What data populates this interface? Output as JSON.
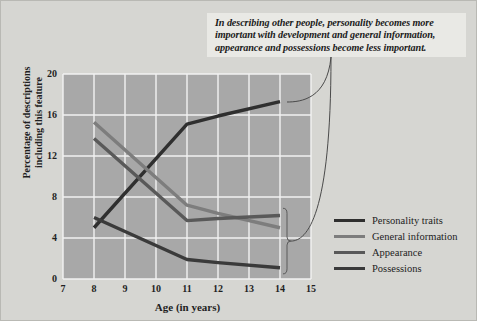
{
  "annotation": {
    "text": "In describing other people, personality becomes more important with development and general information, appearance and possessions become less important."
  },
  "chart_data": {
    "type": "line",
    "title": "",
    "xlabel": "Age (in years)",
    "ylabel": "Percentage of descriptions including this feature",
    "xlim": [
      7,
      15
    ],
    "ylim": [
      0,
      20
    ],
    "xticks": [
      "7",
      "8",
      "9",
      "10",
      "11",
      "12",
      "13",
      "14",
      "15"
    ],
    "yticks": [
      "0",
      "4",
      "8",
      "12",
      "16",
      "20"
    ],
    "grid": true,
    "legend_position": "right",
    "x": [
      8,
      11,
      12,
      14
    ],
    "series": [
      {
        "name": "Personality traits",
        "color": "#2f2f2f",
        "values": [
          5.0,
          15.1,
          15.9,
          17.3
        ]
      },
      {
        "name": "General information",
        "color": "#7d7d7d",
        "values": [
          15.3,
          7.2,
          6.4,
          5.0
        ]
      },
      {
        "name": "Appearance",
        "color": "#595959",
        "values": [
          13.7,
          5.7,
          5.9,
          6.2
        ]
      },
      {
        "name": "Possessions",
        "color": "#3a3a3a",
        "values": [
          6.0,
          1.9,
          1.6,
          1.1
        ]
      }
    ]
  },
  "legend": {
    "items": [
      {
        "label": "Personality traits",
        "color": "#2f2f2f"
      },
      {
        "label": "General information",
        "color": "#7d7d7d"
      },
      {
        "label": "Appearance",
        "color": "#595959"
      },
      {
        "label": "Possessions",
        "color": "#3a3a3a"
      }
    ]
  },
  "style": {
    "page_background": "#d6d6d2",
    "plot_background": "#a8a8a8",
    "gridline_color": "#f2f2f2",
    "annotation_background": "#e9e9e5",
    "text_color": "#1f1f1f"
  }
}
